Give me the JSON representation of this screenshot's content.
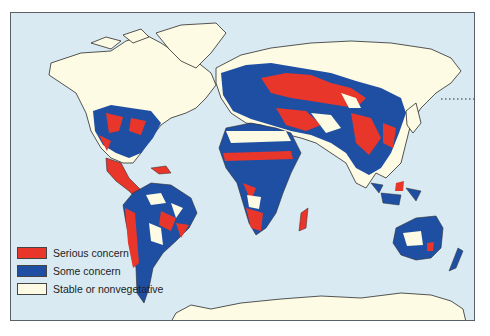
{
  "map": {
    "title": "",
    "subject": "World vegetation degradation concern",
    "colors": {
      "ocean": "#d9eaf3",
      "serious": "#e8362a",
      "some": "#1f4fa3",
      "stable": "#fdfbe3",
      "outline": "#2b2b2b"
    }
  },
  "legend": {
    "items": [
      {
        "label": "Serious concern",
        "color": "#e8362a"
      },
      {
        "label": "Some concern",
        "color": "#1f4fa3"
      },
      {
        "label": "Stable or nonvegetative",
        "color": "#fdfbe3"
      }
    ]
  }
}
